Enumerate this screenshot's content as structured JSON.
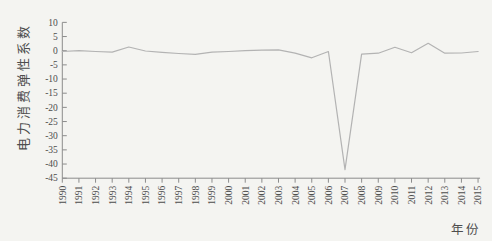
{
  "chart_data": {
    "type": "line",
    "title": "",
    "xlabel": "年份",
    "ylabel": "电力消费弹性系数",
    "x": [
      1990,
      1991,
      1992,
      1993,
      1994,
      1995,
      1996,
      1997,
      1998,
      1999,
      2000,
      2001,
      2002,
      2003,
      2004,
      2005,
      2006,
      2007,
      2008,
      2009,
      2010,
      2011,
      2012,
      2013,
      2014,
      2015
    ],
    "series": [
      {
        "name": "电力消费弹性系数",
        "values": [
          -0.3,
          0.0,
          -0.3,
          -0.5,
          1.3,
          -0.1,
          -0.6,
          -1.0,
          -1.3,
          -0.5,
          -0.3,
          0.0,
          0.2,
          0.3,
          -0.9,
          -2.5,
          -0.3,
          -42.0,
          -1.2,
          -0.9,
          1.2,
          -0.7,
          2.6,
          -0.9,
          -0.8,
          -0.3
        ]
      }
    ],
    "ylim": [
      -45,
      10
    ],
    "ytick_step": 5,
    "yticks": [
      10,
      5,
      0,
      -5,
      -10,
      -15,
      -20,
      -25,
      -30,
      -35,
      -40,
      -45
    ],
    "grid": false,
    "legend": "none",
    "x_tick_label_rotation": 90,
    "line_color": "#b3b3b3",
    "axis_color": "#8c8c8c",
    "text_color": "#4d4d4d",
    "background": "#f4f4f1"
  }
}
